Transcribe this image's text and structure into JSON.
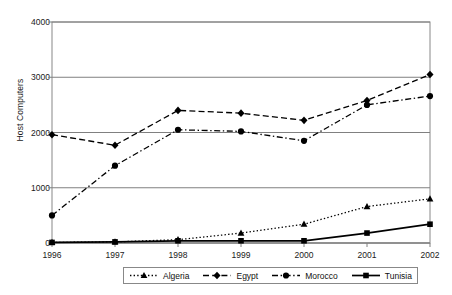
{
  "chart_data": {
    "type": "line",
    "title": "",
    "xlabel": "",
    "ylabel": "Host Computers",
    "categories": [
      "1996",
      "1997",
      "1998",
      "1999",
      "2000",
      "2001",
      "2002"
    ],
    "ylim": [
      0,
      4000
    ],
    "yticks": [
      0,
      1000,
      2000,
      3000,
      4000
    ],
    "ytick_labels": [
      "0",
      "1000",
      "2000",
      "3000",
      "4000"
    ],
    "grid": "horizontal",
    "legend_position": "bottom",
    "series": [
      {
        "name": "Algeria",
        "marker": "triangle",
        "line_style": "dotted",
        "color": "#000000",
        "values": [
          10,
          20,
          60,
          180,
          340,
          660,
          800
        ]
      },
      {
        "name": "Egypt",
        "marker": "diamond",
        "line_style": "dashed",
        "color": "#000000",
        "values": [
          1960,
          1770,
          2400,
          2350,
          2220,
          2580,
          3050
        ]
      },
      {
        "name": "Morocco",
        "marker": "circle",
        "line_style": "dash-dot",
        "color": "#000000",
        "values": [
          500,
          1400,
          2050,
          2020,
          1850,
          2500,
          2660
        ]
      },
      {
        "name": "Tunisia",
        "marker": "square",
        "line_style": "solid",
        "color": "#000000",
        "values": [
          10,
          20,
          40,
          40,
          40,
          180,
          340
        ]
      }
    ]
  },
  "axis": {
    "y_title": "Host Computers"
  },
  "legend": {
    "items": [
      {
        "label": "Algeria"
      },
      {
        "label": "Egypt"
      },
      {
        "label": "Morocco"
      },
      {
        "label": "Tunisia"
      }
    ]
  },
  "colors": {
    "ink": "#000000",
    "grid": "#808080",
    "border": "#888888",
    "background": "#ffffff"
  }
}
